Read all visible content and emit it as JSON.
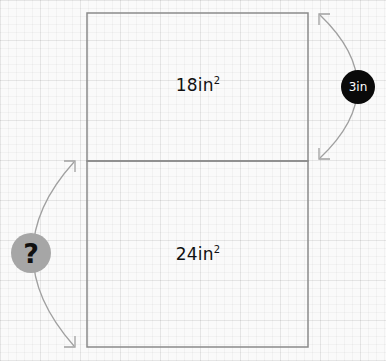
{
  "diagram": {
    "type": "area-model",
    "top_rectangle": {
      "area_value": "18",
      "area_unit": "in",
      "area_exponent": "2"
    },
    "bottom_rectangle": {
      "area_value": "24",
      "area_unit": "in",
      "area_exponent": "2"
    },
    "known_side": {
      "label": "3in",
      "applies_to": "top rectangle height"
    },
    "unknown_side": {
      "label": "?",
      "applies_to": "bottom rectangle height"
    },
    "colors": {
      "outline": "#8a8a8a",
      "arrow": "#a0a0a0",
      "known_badge": "#0a0a0a",
      "unknown_badge": "#a6a6a6",
      "text": "#111111"
    }
  }
}
